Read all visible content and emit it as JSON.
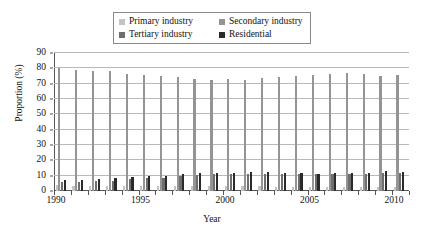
{
  "chart_data": {
    "type": "bar",
    "title": "",
    "xlabel": "Year",
    "ylabel": "Proportion (%)",
    "ylim": [
      0,
      90
    ],
    "ytick_step": 10,
    "yticks": [
      0,
      10,
      20,
      30,
      40,
      50,
      60,
      70,
      80,
      90
    ],
    "xlim": [
      1990,
      2010
    ],
    "xtick_labels": [
      "1990",
      "1995",
      "2000",
      "2005",
      "2010"
    ],
    "xtick_label_years": [
      1990,
      1995,
      2000,
      2005,
      2010
    ],
    "grid": "horizontal",
    "legend_position": "top-center",
    "categories": [
      1990,
      1991,
      1992,
      1993,
      1994,
      1995,
      1996,
      1997,
      1998,
      1999,
      2000,
      2001,
      2002,
      2003,
      2004,
      2005,
      2006,
      2007,
      2008,
      2009,
      2010
    ],
    "series": [
      {
        "name": "Primary industry",
        "color": "#c4c4c4",
        "values": [
          3.6,
          3.5,
          3.4,
          3.4,
          3.3,
          3.4,
          3.3,
          3.4,
          3.5,
          3.5,
          3.3,
          3.2,
          3.1,
          2.9,
          2.7,
          2.6,
          2.6,
          2.5,
          2.5,
          2.5,
          2.4
        ]
      },
      {
        "name": "Secondary industry",
        "color": "#949494",
        "values": [
          80.0,
          78.6,
          78.0,
          78.0,
          76.2,
          75.6,
          75.2,
          74.4,
          72.8,
          72.6,
          72.8,
          72.4,
          73.6,
          74.2,
          75.2,
          75.8,
          76.4,
          77.0,
          76.2,
          75.2,
          75.6
        ]
      },
      {
        "name": "Tertiary industry",
        "color": "#6e6e6e",
        "values": [
          5.9,
          6.2,
          6.6,
          6.8,
          7.6,
          8.2,
          8.8,
          9.6,
          10.4,
          10.8,
          10.9,
          11.0,
          11.3,
          11.3,
          11.2,
          11.0,
          11.1,
          11.1,
          11.2,
          11.5,
          11.7
        ]
      },
      {
        "name": "Residential",
        "color": "#2a2a2a",
        "values": [
          7.4,
          7.5,
          8.0,
          8.2,
          9.0,
          9.6,
          9.9,
          10.8,
          11.6,
          11.9,
          12.0,
          12.2,
          12.2,
          11.9,
          11.6,
          11.4,
          11.7,
          11.7,
          11.9,
          12.8,
          12.4
        ]
      }
    ]
  },
  "legend": {
    "items": [
      {
        "label": "Primary industry",
        "color": "#c4c4c4"
      },
      {
        "label": "Secondary industry",
        "color": "#949494"
      },
      {
        "label": "Tertiary industry",
        "color": "#6e6e6e"
      },
      {
        "label": "Residential",
        "color": "#2a2a2a"
      }
    ]
  }
}
